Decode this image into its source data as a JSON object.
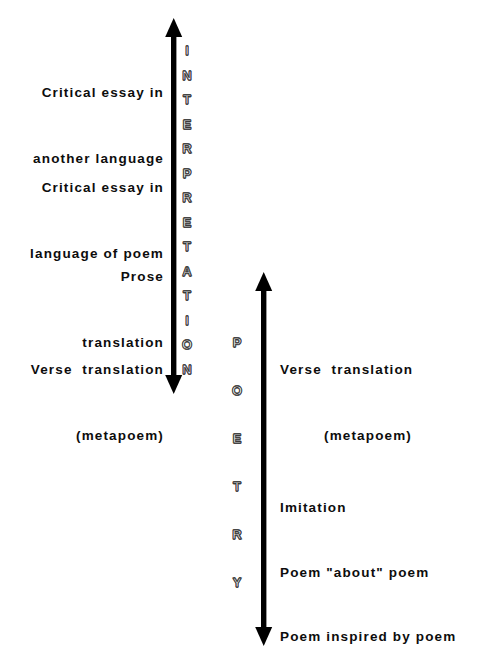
{
  "diagram": {
    "background_color": "#ffffff",
    "text_color": "#0d0d0d",
    "axis_color": "#000000",
    "axes": [
      {
        "id": "interpretation",
        "name": "INTERPRETATION",
        "letters": [
          "I",
          "N",
          "T",
          "E",
          "R",
          "P",
          "R",
          "E",
          "T",
          "A",
          "T",
          "I",
          "O",
          "N"
        ],
        "style": "outline",
        "arrowheads": "both"
      },
      {
        "id": "poetry",
        "name": "POETRY",
        "letters": [
          "P",
          "O",
          "E",
          "T",
          "R",
          "Y"
        ],
        "style": "outline",
        "arrowheads": "both"
      }
    ],
    "left_labels": [
      {
        "id": "critical-essay-another-language",
        "lines": [
          "Critical essay in",
          "another language"
        ]
      },
      {
        "id": "critical-essay-language-of-poem",
        "lines": [
          "Critical essay in",
          "language of poem"
        ]
      },
      {
        "id": "prose-translation",
        "lines": [
          "Prose",
          "translation"
        ]
      },
      {
        "id": "verse-translation-metapoem-left",
        "lines": [
          "Verse  translation",
          "(metapoem)"
        ]
      }
    ],
    "right_labels": [
      {
        "id": "verse-translation-metapoem-right",
        "lines": [
          "Verse  translation",
          "(metapoem)"
        ]
      },
      {
        "id": "imitation",
        "lines": [
          "Imitation"
        ]
      },
      {
        "id": "poem-about-poem",
        "lines": [
          "Poem \"about\" poem"
        ]
      },
      {
        "id": "poem-inspired-by-poem",
        "lines": [
          "Poem inspired by poem"
        ]
      }
    ]
  }
}
